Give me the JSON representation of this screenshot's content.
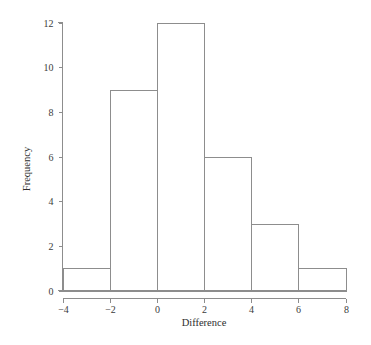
{
  "chart_data": {
    "type": "bar",
    "title": "",
    "subtitle": "",
    "xlabel": "Difference",
    "ylabel": "Frequency",
    "xlim": [
      -4,
      8
    ],
    "ylim": [
      0,
      12
    ],
    "bin_width": 2,
    "grid": false,
    "legend": null,
    "bin_edges": [
      -4,
      -2,
      0,
      2,
      4,
      6,
      8
    ],
    "categories": [
      "-4 to -2",
      "-2 to 0",
      "0 to 2",
      "2 to 4",
      "4 to 6",
      "6 to 8"
    ],
    "values": [
      1,
      9,
      12,
      6,
      3,
      1
    ],
    "bars": [
      {
        "label": "-4 to -2",
        "x0": -4,
        "x1": -2,
        "frequency": 1
      },
      {
        "label": "-2 to 0",
        "x0": -2,
        "x1": 0,
        "frequency": 9
      },
      {
        "label": "0 to 2",
        "x0": 0,
        "x1": 2,
        "frequency": 12
      },
      {
        "label": "2 to 4",
        "x0": 2,
        "x1": 4,
        "frequency": 6
      },
      {
        "label": "4 to 6",
        "x0": 4,
        "x1": 6,
        "frequency": 3
      },
      {
        "label": "6 to 8",
        "x0": 6,
        "x1": 8,
        "frequency": 1
      }
    ],
    "x_ticks": [
      {
        "value": -4,
        "label": "−4"
      },
      {
        "value": -2,
        "label": "−2"
      },
      {
        "value": 0,
        "label": "0"
      },
      {
        "value": 2,
        "label": "2"
      },
      {
        "value": 4,
        "label": "4"
      },
      {
        "value": 6,
        "label": "6"
      },
      {
        "value": 8,
        "label": "8"
      }
    ],
    "y_ticks": [
      {
        "value": 0,
        "label": "0"
      },
      {
        "value": 2,
        "label": "2"
      },
      {
        "value": 4,
        "label": "4"
      },
      {
        "value": 6,
        "label": "6"
      },
      {
        "value": 8,
        "label": "8"
      },
      {
        "value": 10,
        "label": "10"
      },
      {
        "value": 12,
        "label": "12"
      }
    ],
    "colors": {
      "line": "#8d8d8d",
      "text": "#333333",
      "background": "#ffffff"
    },
    "total_count": 32
  },
  "axis_labels": {
    "x_title": "Difference",
    "y_title": "Frequency"
  },
  "tick_text": {
    "x": [
      "−4",
      "−2",
      "0",
      "2",
      "4",
      "6",
      "8"
    ],
    "y": [
      "0",
      "2",
      "4",
      "6",
      "8",
      "10",
      "12"
    ]
  }
}
